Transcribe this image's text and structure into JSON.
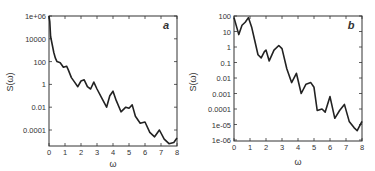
{
  "chart_data": [
    {
      "type": "line",
      "panel_label": "a",
      "title": "",
      "xlabel": "ω",
      "ylabel": "S(ω)",
      "yscale": "log",
      "xlim": [
        0,
        8
      ],
      "ylim": [
        4e-06,
        1000000.0
      ],
      "x_ticks": [
        "0",
        "1",
        "2",
        "3",
        "4",
        "5",
        "6",
        "7",
        "8"
      ],
      "y_ticks": [
        "1e+06",
        "10000",
        "100",
        "1",
        "0.01",
        "0.0001"
      ],
      "grid": false,
      "legend": null,
      "series": [
        {
          "name": "S(ω)",
          "x": [
            0,
            0.05,
            0.1,
            0.2,
            0.3,
            0.4,
            0.5,
            0.7,
            0.9,
            1.1,
            1.2,
            1.4,
            1.6,
            1.8,
            2.0,
            2.2,
            2.4,
            2.6,
            2.8,
            3.0,
            3.3,
            3.6,
            3.8,
            4.0,
            4.2,
            4.5,
            4.8,
            5.0,
            5.2,
            5.4,
            5.7,
            6.0,
            6.3,
            6.6,
            6.9,
            7.2,
            7.5,
            7.8,
            8.0
          ],
          "log10_y": [
            6,
            5.5,
            4.2,
            3.5,
            2.8,
            2.3,
            2.0,
            1.9,
            1.5,
            1.6,
            1.3,
            0.6,
            0.2,
            -0.2,
            0.3,
            0.4,
            -0.2,
            -0.4,
            0.2,
            -0.4,
            -1.2,
            -2.0,
            -1.0,
            -0.6,
            -1.4,
            -2.4,
            -2.0,
            -2.1,
            -1.8,
            -2.8,
            -3.4,
            -3.3,
            -4.2,
            -4.6,
            -4.0,
            -4.8,
            -5.2,
            -5.1,
            -4.7
          ]
        }
      ]
    },
    {
      "type": "line",
      "panel_label": "b",
      "title": "",
      "xlabel": "ω",
      "ylabel": "S(ω)",
      "yscale": "log",
      "xlim": [
        0,
        8
      ],
      "ylim": [
        1e-06,
        100
      ],
      "x_ticks": [
        "0",
        "1",
        "2",
        "3",
        "4",
        "5",
        "6",
        "7",
        "8"
      ],
      "y_ticks": [
        "100",
        "10",
        "1",
        "0.1",
        "0.01",
        "0.001",
        "0.0001",
        "1e-05",
        "1e-06"
      ],
      "grid": false,
      "legend": null,
      "series": [
        {
          "name": "S(ω)",
          "x": [
            0,
            0.3,
            0.5,
            0.7,
            0.9,
            1.1,
            1.3,
            1.5,
            1.7,
            1.9,
            2.0,
            2.2,
            2.5,
            2.8,
            3.0,
            3.3,
            3.6,
            3.9,
            4.2,
            4.5,
            4.8,
            5.0,
            5.2,
            5.5,
            5.7,
            6.0,
            6.3,
            6.6,
            6.9,
            7.2,
            7.5,
            7.7,
            8.0
          ],
          "log10_y": [
            1.9,
            0.8,
            1.4,
            1.6,
            1.9,
            1.3,
            0.4,
            -0.5,
            -0.7,
            -0.3,
            -0.2,
            -0.9,
            -0.2,
            0.1,
            -0.1,
            -1.4,
            -2.3,
            -1.7,
            -3.0,
            -2.4,
            -2.3,
            -2.6,
            -4.1,
            -4.0,
            -4.2,
            -3.2,
            -4.6,
            -4.1,
            -3.7,
            -4.8,
            -5.2,
            -5.4,
            -4.8
          ]
        }
      ]
    }
  ]
}
